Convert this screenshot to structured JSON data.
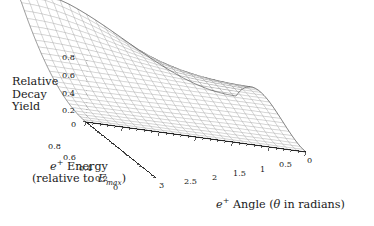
{
  "figure": {
    "background": "#ffffff",
    "ink": "#1a1a1a",
    "surface_fill": "#a8a8a8",
    "surface_mesh": "#2b2b2b",
    "surface_underside": "#ffffff"
  },
  "axes": {
    "z": {
      "title_lines": [
        "Relative",
        "Decay",
        "Yield"
      ],
      "ticks": [
        "0.8",
        "0.6",
        "0.4",
        "0.2",
        "0"
      ],
      "tick_values": [
        0.8,
        0.6,
        0.4,
        0.2,
        0
      ],
      "range": [
        0,
        0.9
      ]
    },
    "energy": {
      "title_line1_prefix": "e",
      "title_line1_sup": "+",
      "title_line1_rest": " Energy",
      "title_line2_prefix": "(relative to ",
      "title_line2_var": "E",
      "title_line2_sub": "max",
      "title_line2_suffix": ")",
      "ticks": [
        "0.8",
        "0.6",
        "0.4",
        "0.2",
        "0"
      ],
      "tick_values": [
        0.8,
        0.6,
        0.4,
        0.2,
        0
      ],
      "range": [
        0,
        1
      ]
    },
    "angle": {
      "title_prefix": "e",
      "title_sup": "+",
      "title_mid": " Angle (",
      "title_theta": "θ",
      "title_rest": " in radians)",
      "ticks": [
        "3",
        "2.5",
        "2",
        "1.5",
        "1",
        "0.5",
        "0"
      ],
      "tick_values": [
        3,
        2.5,
        2,
        1.5,
        1,
        0.5,
        0
      ],
      "range": [
        0,
        3.14159
      ]
    }
  },
  "chart_data": {
    "type": "surface",
    "title": "",
    "xlabel": "e+ Angle (theta in radians)",
    "ylabel": "e+ Energy (relative to Emax)",
    "zlabel": "Relative Decay Yield",
    "xlim": [
      0,
      3.14159
    ],
    "ylim": [
      0,
      1
    ],
    "zlim": [
      0,
      0.9
    ],
    "grid": false,
    "legend": "none",
    "x_samples": 26,
    "y_samples": 26,
    "formula": "z = y^2 * (3 - 2*y) * (1 - (2*y - 1)/(3 - 2*y) * cos(theta)) / 2",
    "z_peak": 0.9,
    "z_peak_at": {
      "angle": 0.0,
      "energy": 1.0
    },
    "z_min": 0.0,
    "view": {
      "azimuth_deg": -52,
      "elevation_deg": 22
    },
    "projection": {
      "origin_px": [
        86,
        122
      ],
      "angle_axis_end_px": [
        306,
        152
      ],
      "energy_axis_end_px": [
        156,
        178
      ],
      "z_axis_top_px": [
        86,
        50
      ]
    },
    "sample_points": [
      {
        "energy": 1.0,
        "angle": 0.0,
        "z": 0.9
      },
      {
        "energy": 1.0,
        "angle": 1.57,
        "z": 0.5
      },
      {
        "energy": 1.0,
        "angle": 3.14,
        "z": 0.1
      },
      {
        "energy": 0.8,
        "angle": 0.0,
        "z": 0.56
      },
      {
        "energy": 0.8,
        "angle": 1.57,
        "z": 0.35
      },
      {
        "energy": 0.8,
        "angle": 3.14,
        "z": 0.14
      },
      {
        "energy": 0.6,
        "angle": 0.0,
        "z": 0.3
      },
      {
        "energy": 0.6,
        "angle": 1.57,
        "z": 0.22
      },
      {
        "energy": 0.6,
        "angle": 3.14,
        "z": 0.13
      },
      {
        "energy": 0.4,
        "angle": 0.0,
        "z": 0.12
      },
      {
        "energy": 0.4,
        "angle": 1.57,
        "z": 0.11
      },
      {
        "energy": 0.4,
        "angle": 3.14,
        "z": 0.09
      },
      {
        "energy": 0.2,
        "angle": 0.0,
        "z": 0.025
      },
      {
        "energy": 0.2,
        "angle": 1.57,
        "z": 0.03
      },
      {
        "energy": 0.2,
        "angle": 3.14,
        "z": 0.035
      },
      {
        "energy": 0.0,
        "angle": 0.0,
        "z": 0.0
      },
      {
        "energy": 0.0,
        "angle": 3.14,
        "z": 0.0
      }
    ]
  },
  "tick_positions": {
    "z": [
      {
        "label": "0.8",
        "x": 62,
        "y": 52
      },
      {
        "label": "0.6",
        "x": 62,
        "y": 70
      },
      {
        "label": "0.4",
        "x": 62,
        "y": 88
      },
      {
        "label": "0.6",
        "x": 62,
        "y": 70
      },
      {
        "label": "0.2",
        "x": 62,
        "y": 105
      },
      {
        "label": "0",
        "x": 71,
        "y": 119
      }
    ],
    "energy": [
      {
        "label": "0.8",
        "x": 48,
        "y": 141
      },
      {
        "label": "0.6",
        "x": 63,
        "y": 152
      },
      {
        "label": "0.4",
        "x": 79,
        "y": 163
      },
      {
        "label": "0.2",
        "x": 95,
        "y": 173
      },
      {
        "label": "0",
        "x": 113,
        "y": 182
      }
    ],
    "angle": [
      {
        "label": "3",
        "x": 159,
        "y": 180
      },
      {
        "label": "2.5",
        "x": 184,
        "y": 176
      },
      {
        "label": "2",
        "x": 212,
        "y": 172
      },
      {
        "label": "1.5",
        "x": 233,
        "y": 168
      },
      {
        "label": "1",
        "x": 260,
        "y": 164
      },
      {
        "label": "0.5",
        "x": 279,
        "y": 159
      },
      {
        "label": "0",
        "x": 307,
        "y": 155
      }
    ]
  }
}
